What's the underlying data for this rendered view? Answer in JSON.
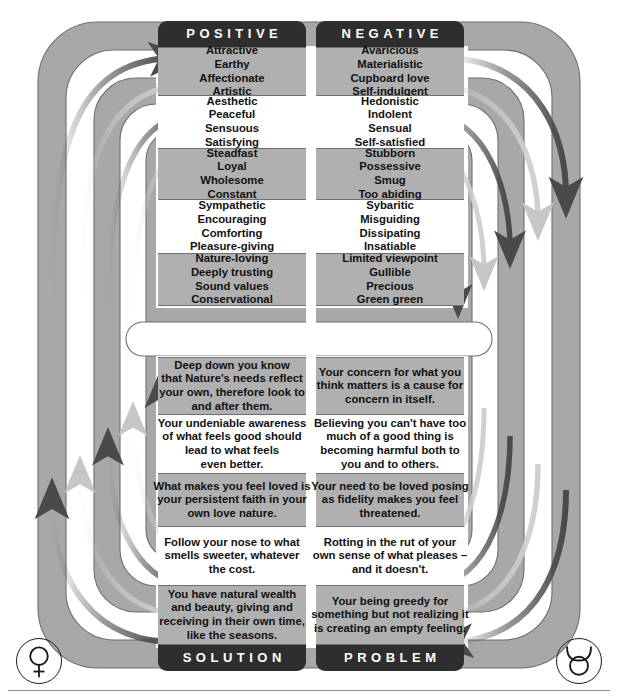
{
  "diagram": {
    "colors": {
      "band_gray": "#a8a8a8",
      "panel_gray": "#b0b0b0",
      "tab_dark": "#2e2e2e",
      "arrow_dark": "#4a4a4a",
      "arrow_light": "#cfcfcf",
      "text": "#111111",
      "outline": "#6f6f6f"
    },
    "headers": {
      "top_left": "POSITIVE",
      "top_right": "NEGATIVE",
      "bottom_left": "SOLUTION",
      "bottom_right": "PROBLEM"
    },
    "glyphs": {
      "left": "venus-symbol",
      "right": "taurus-symbol"
    },
    "top_rows": [
      {
        "shade": "gray",
        "positive": "Attractive\nEarthy\nAffectionate\nArtistic",
        "negative": "Avaricious\nMaterialistic\nCupboard love\nSelf-indulgent"
      },
      {
        "shade": "white",
        "positive": "Aesthetic\nPeaceful\nSensuous\nSatisfying",
        "negative": "Hedonistic\nIndolent\nSensual\nSelf-satisfied"
      },
      {
        "shade": "gray",
        "positive": "Steadfast\nLoyal\nWholesome\nConstant",
        "negative": "Stubborn\nPossessive\nSmug\nToo abiding"
      },
      {
        "shade": "white",
        "positive": "Sympathetic\nEncouraging\nComforting\nPleasure-giving",
        "negative": "Sybaritic\nMisguiding\nDissipating\nInsatiable"
      },
      {
        "shade": "gray",
        "positive": "Nature-loving\nDeeply trusting\nSound values\nConservational",
        "negative": "Limited viewpoint\nGullible\nPrecious\nGreen green"
      }
    ],
    "bottom_rows": [
      {
        "shade": "gray",
        "solution": "Deep down you know\nthat Nature's needs reflect\nyour own, therefore look to\nand after them.",
        "problem": "Your concern for what you\nthink matters is a cause for\nconcern in itself."
      },
      {
        "shade": "white",
        "solution": "Your undeniable awareness\nof what feels good should\nlead to what feels\neven better.",
        "problem": "Believing you can't have too\nmuch of a good thing is\nbecoming harmful both to\nyou and to others."
      },
      {
        "shade": "gray",
        "solution": "What makes you feel loved is\nyour persistent faith in your\nown love nature.",
        "problem": "Your need to be loved posing\nas fidelity makes you feel\nthreatened."
      },
      {
        "shade": "white",
        "solution": "Follow your nose to what\nsmells sweeter, whatever\nthe cost.",
        "problem": "Rotting in the rut of your\nown sense of what pleases –\nand it doesn't."
      },
      {
        "shade": "gray",
        "solution": "You have natural wealth\nand beauty, giving and\nreceiving in their own time,\nlike the seasons.",
        "problem": "Your being greedy for\nsomething but not realizing it\nis creating an empty feeling."
      }
    ]
  }
}
